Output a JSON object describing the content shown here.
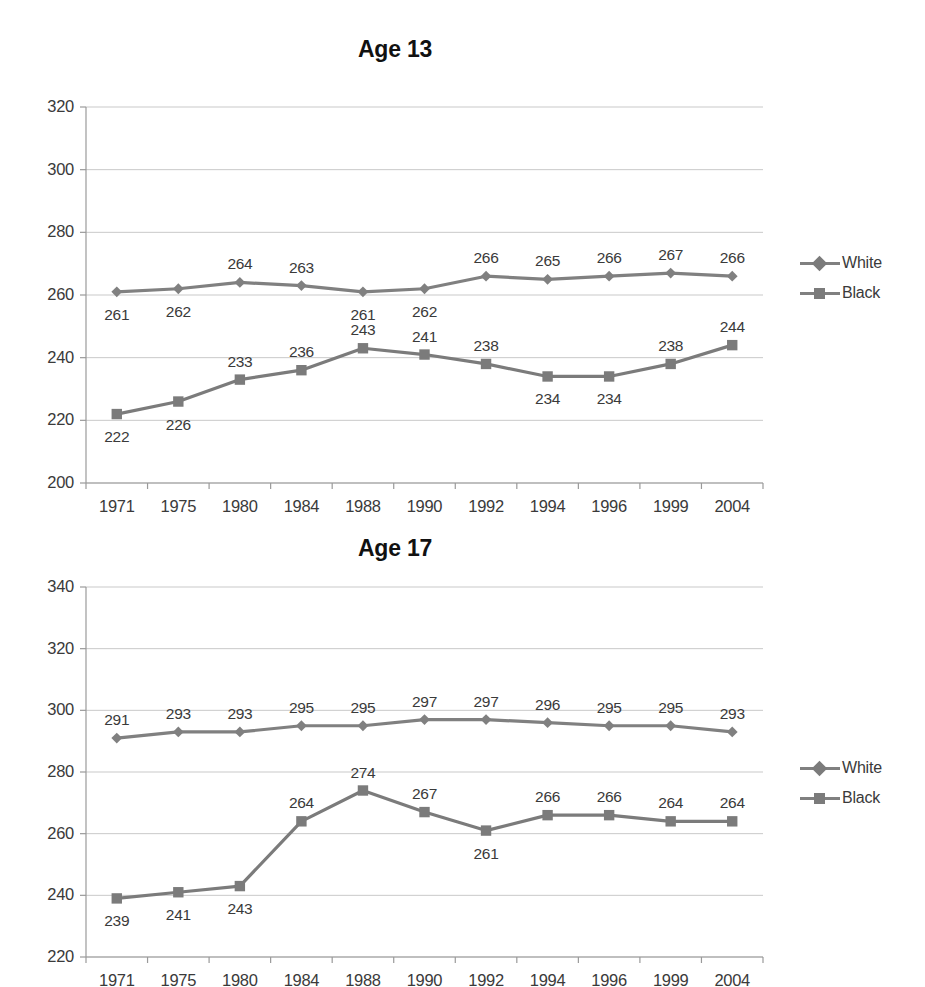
{
  "page": {
    "background": "#ffffff",
    "series_colors": {
      "white": "#808080",
      "black": "#7b7b7b"
    },
    "grid_color": "#c9c9c9",
    "axis_color": "#9a9a9a"
  },
  "charts": [
    {
      "id": "age13",
      "title": "Age 13",
      "legend": [
        {
          "label": "White",
          "marker": "diamond"
        },
        {
          "label": "Black",
          "marker": "square"
        }
      ],
      "chart_data": {
        "type": "line",
        "title": "Age 13",
        "xlabel": "",
        "ylabel": "",
        "categories": [
          "1971",
          "1975",
          "1980",
          "1984",
          "1988",
          "1990",
          "1992",
          "1994",
          "1996",
          "1999",
          "2004"
        ],
        "series": [
          {
            "name": "White",
            "marker": "diamond",
            "values": [
              261,
              262,
              264,
              263,
              261,
              262,
              266,
              265,
              266,
              267,
              266
            ]
          },
          {
            "name": "Black",
            "marker": "square",
            "values": [
              222,
              226,
              233,
              236,
              243,
              241,
              238,
              234,
              234,
              238,
              244
            ]
          }
        ],
        "ylim": [
          200,
          320
        ],
        "yticks": [
          200,
          220,
          240,
          260,
          280,
          300,
          320
        ],
        "grid": true,
        "legend_position": "right",
        "data_labels": true
      }
    },
    {
      "id": "age17",
      "title": "Age 17",
      "legend": [
        {
          "label": "White",
          "marker": "diamond"
        },
        {
          "label": "Black",
          "marker": "square"
        }
      ],
      "chart_data": {
        "type": "line",
        "title": "Age 17",
        "xlabel": "",
        "ylabel": "",
        "categories": [
          "1971",
          "1975",
          "1980",
          "1984",
          "1988",
          "1990",
          "1992",
          "1994",
          "1996",
          "1999",
          "2004"
        ],
        "series": [
          {
            "name": "White",
            "marker": "diamond",
            "values": [
              291,
              293,
              293,
              295,
              295,
              297,
              297,
              296,
              295,
              295,
              293
            ]
          },
          {
            "name": "Black",
            "marker": "square",
            "values": [
              239,
              241,
              243,
              264,
              274,
              267,
              261,
              266,
              266,
              264,
              264
            ]
          }
        ],
        "ylim": [
          220,
          340
        ],
        "yticks": [
          220,
          240,
          260,
          280,
          300,
          320,
          340
        ],
        "grid": true,
        "legend_position": "right",
        "data_labels": true
      }
    }
  ]
}
